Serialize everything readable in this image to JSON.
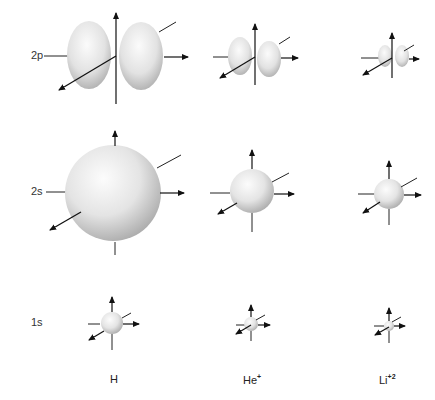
{
  "figure": {
    "rows": [
      {
        "id": "2p",
        "label": "2p",
        "y": 56
      },
      {
        "id": "2s",
        "label": "2s",
        "y": 193
      },
      {
        "id": "1s",
        "label": "1s",
        "y": 323
      }
    ],
    "columns": [
      {
        "id": "H",
        "label": "H",
        "sup": "",
        "x": 113
      },
      {
        "id": "He",
        "label": "He",
        "sup": "+",
        "x": 254
      },
      {
        "id": "Li",
        "label": "Li",
        "sup": "+2",
        "x": 392
      }
    ],
    "orbitals": {
      "2p": [
        {
          "atom": "H",
          "lobe_rx": 28,
          "lobe_ry": 36,
          "gap": 1
        },
        {
          "atom": "He",
          "lobe_rx": 13,
          "lobe_ry": 19,
          "gap": 1
        },
        {
          "atom": "Li",
          "lobe_rx": 8,
          "lobe_ry": 12,
          "gap": 1
        }
      ],
      "2s": [
        {
          "atom": "H",
          "r": 48
        },
        {
          "atom": "He",
          "r": 22
        },
        {
          "atom": "Li",
          "r": 15
        }
      ],
      "1s": [
        {
          "atom": "H",
          "r": 11
        },
        {
          "atom": "He",
          "r": 7
        },
        {
          "atom": "Li",
          "r": 5
        }
      ]
    },
    "colors": {
      "background": "#ffffff",
      "sphere_light": "#fafafa",
      "sphere_dark": "#b8b8b8",
      "axis": "#111111"
    }
  }
}
